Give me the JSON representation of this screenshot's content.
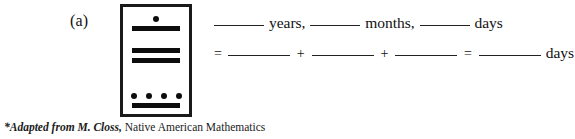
{
  "figure": {
    "part_label": "(a)",
    "mayan_numeral": {
      "description": "Mayan numeral card with three positional groups",
      "groups": [
        {
          "name": "top-group",
          "dots": 1,
          "bars": 1,
          "value": 6
        },
        {
          "name": "middle-group",
          "dots": 0,
          "bars": 2,
          "value": 10
        },
        {
          "name": "bottom-group",
          "dots": 4,
          "bars": 1,
          "value": 9
        }
      ]
    }
  },
  "answer": {
    "line1": {
      "blank1": "",
      "unit1": "years,",
      "blank2": "",
      "unit2": "months,",
      "blank3": "",
      "unit3": "days"
    },
    "line2": {
      "equals_lead": "=",
      "blank1": "",
      "plus1": "+",
      "blank2": "",
      "plus2": "+",
      "blank3": "",
      "equals_mid": "=",
      "blank4": "",
      "unit": "days"
    }
  },
  "footnote": {
    "italic_part": "*Adapted from M. Closs,",
    "roman_part": " Native American Mathematics"
  },
  "colors": {
    "ink": "#0d0d0d",
    "card_border": "#1a1a1a",
    "page_background": "#ffffff",
    "rule_line": "#222222"
  }
}
